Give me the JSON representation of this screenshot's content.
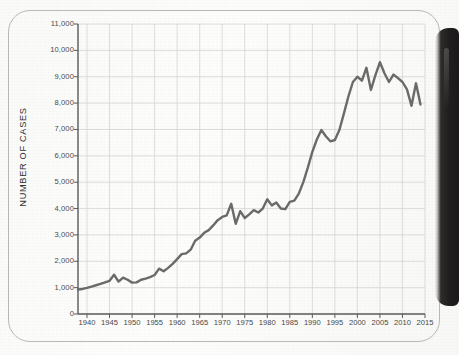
{
  "figure": {
    "card_label": "chart-card",
    "spine_color": "#211f1f",
    "background_color": "#fdfdfc"
  },
  "chart_data": {
    "type": "line",
    "title": "",
    "subtitle": "",
    "xlabel": "",
    "ylabel": "NUMBER OF CASES",
    "xlim": [
      1938,
      2015
    ],
    "ylim": [
      0,
      11000
    ],
    "grid": true,
    "legend": "none",
    "line_color": "#6b6b6b",
    "grid_color": "#d6d6d4",
    "axis_color": "#5a5a5a",
    "yticks": [
      0,
      1000,
      2000,
      3000,
      4000,
      5000,
      6000,
      7000,
      8000,
      9000,
      10000,
      11000
    ],
    "ytick_labels": [
      "0",
      "1,000",
      "2,000",
      "3,000",
      "4,000",
      "5,000",
      "6,000",
      "7,000",
      "8,000",
      "9,000",
      "10,000",
      "11,000"
    ],
    "xticks": [
      1940,
      1945,
      1950,
      1955,
      1960,
      1965,
      1970,
      1975,
      1980,
      1985,
      1990,
      1995,
      2000,
      2005,
      2010,
      2015
    ],
    "xtick_labels": [
      "1940",
      "1945",
      "1950",
      "1955",
      "1960",
      "1965",
      "1970",
      "1975",
      "1980",
      "1985",
      "1990",
      "1995",
      "2000",
      "2005",
      "2010",
      "2015"
    ],
    "series": [
      {
        "name": "Number of cases",
        "x": [
          1938,
          1939,
          1940,
          1941,
          1942,
          1943,
          1944,
          1945,
          1946,
          1947,
          1948,
          1949,
          1950,
          1951,
          1952,
          1953,
          1954,
          1955,
          1956,
          1957,
          1958,
          1959,
          1960,
          1961,
          1962,
          1963,
          1964,
          1965,
          1966,
          1967,
          1968,
          1969,
          1970,
          1971,
          1972,
          1973,
          1974,
          1975,
          1976,
          1977,
          1978,
          1979,
          1980,
          1981,
          1982,
          1983,
          1984,
          1985,
          1986,
          1987,
          1988,
          1989,
          1990,
          1991,
          1992,
          1993,
          1994,
          1995,
          1996,
          1997,
          1998,
          1999,
          2000,
          2001,
          2002,
          2003,
          2004,
          2005,
          2006,
          2007,
          2008,
          2009,
          2010,
          2011,
          2012,
          2013,
          2014
        ],
        "y": [
          930,
          950,
          990,
          1040,
          1090,
          1140,
          1200,
          1260,
          1490,
          1230,
          1380,
          1300,
          1190,
          1200,
          1300,
          1340,
          1400,
          1480,
          1720,
          1620,
          1750,
          1900,
          2080,
          2270,
          2300,
          2440,
          2780,
          2900,
          3080,
          3180,
          3360,
          3560,
          3680,
          3740,
          4180,
          3420,
          3900,
          3640,
          3780,
          3940,
          3850,
          4000,
          4350,
          4120,
          4230,
          4000,
          3980,
          4250,
          4300,
          4570,
          5000,
          5550,
          6150,
          6620,
          6980,
          6740,
          6550,
          6600,
          6980,
          7600,
          8250,
          8800,
          9000,
          8850,
          9340,
          8500,
          9060,
          9550,
          9130,
          8800,
          9080,
          8950,
          8800,
          8520,
          7900,
          8750,
          7950
        ]
      }
    ]
  }
}
